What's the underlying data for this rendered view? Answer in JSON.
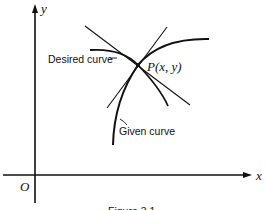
{
  "figure": {
    "axes": {
      "x_label": "x",
      "y_label": "y",
      "origin_label": "O"
    },
    "point_label": "P(x, y)",
    "annotations": {
      "desired": "Desired curve",
      "given": "Given curve"
    },
    "caption_partial": "Figure 3.1"
  }
}
